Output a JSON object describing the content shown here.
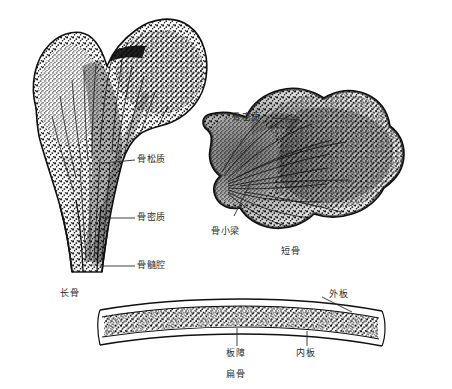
{
  "figure": {
    "kind": "anatomical-illustration",
    "background_color": "#ffffff",
    "ink_color": "#1a1a1a",
    "label_color": "#2b2b2b"
  },
  "labels": {
    "spongy_bone": "骨松质",
    "compact_bone_left": "骨密质",
    "medullary_cavity": "骨髓腔",
    "long_bone": "长骨",
    "compact_bone_right": "骨密质",
    "trabeculae": "骨小梁",
    "short_bone": "短骨",
    "outer_plate": "外板",
    "diploe": "板障",
    "inner_plate": "内板",
    "flat_bone": "扁骨"
  },
  "panels": [
    {
      "name": "long-bone",
      "caption": "长骨",
      "callouts": [
        "骨松质",
        "骨密质",
        "骨髓腔"
      ]
    },
    {
      "name": "short-bone",
      "caption": "短骨",
      "callouts": [
        "骨密质",
        "骨小梁"
      ]
    },
    {
      "name": "flat-bone",
      "caption": "扁骨",
      "callouts": [
        "外板",
        "板障",
        "内板"
      ]
    }
  ]
}
